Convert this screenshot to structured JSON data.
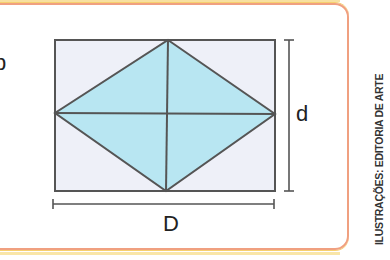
{
  "labels": {
    "long_diagonal": "D",
    "short_diagonal": "d",
    "partial_left_char": "b"
  },
  "credit": "ILUSTRAÇÕES: EDITORIA DE ARTE",
  "colors": {
    "rhombus_fill": "#b8e6f2",
    "rectangle_fill": "#eef0f8",
    "stroke": "#555555",
    "frame_border": "#f0a080"
  }
}
